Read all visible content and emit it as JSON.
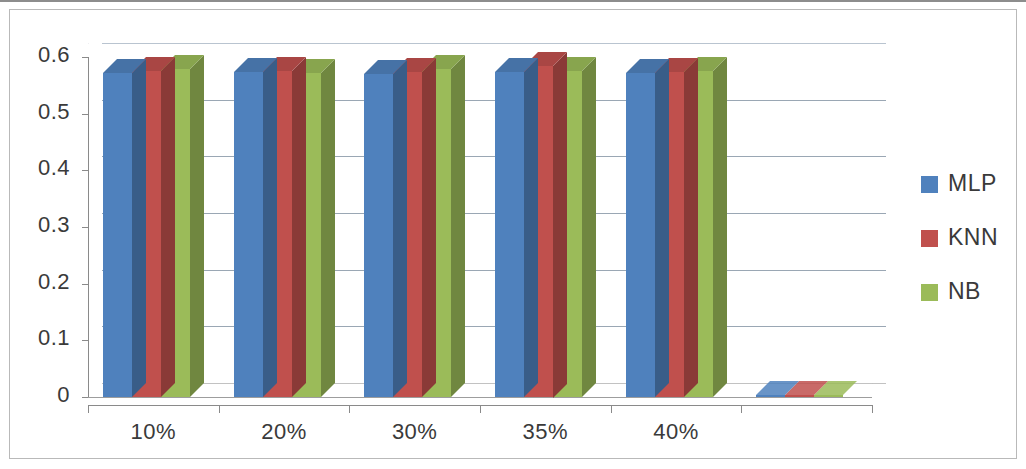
{
  "chart_data": {
    "type": "bar",
    "title": "",
    "subtitle": "",
    "xlabel": "",
    "ylabel": "",
    "categories": [
      "10%",
      "20%",
      "30%",
      "35%",
      "40%",
      ""
    ],
    "series": [
      {
        "name": "MLP",
        "color": "#4f81bd",
        "values": [
          0.572,
          0.574,
          0.57,
          0.573,
          0.572,
          0.0
        ]
      },
      {
        "name": "KNN",
        "color": "#c0504d",
        "values": [
          0.575,
          0.576,
          0.574,
          0.585,
          0.574,
          0.0
        ]
      },
      {
        "name": "NB",
        "color": "#9bbb59",
        "values": [
          0.578,
          0.572,
          0.578,
          0.575,
          0.576,
          0.0
        ]
      }
    ],
    "ylim": [
      0,
      0.6
    ],
    "yticks": [
      "0",
      "0.1",
      "0.2",
      "0.3",
      "0.4",
      "0.5",
      "0.6"
    ],
    "ytick_values": [
      0,
      0.1,
      0.2,
      0.3,
      0.4,
      0.5,
      0.6
    ],
    "grid": true,
    "grid_axis": "y",
    "legend_position": "right",
    "three_d": true
  },
  "legend": {
    "entries": [
      {
        "label": "MLP",
        "color": "#4f81bd"
      },
      {
        "label": "KNN",
        "color": "#c0504d"
      },
      {
        "label": "NB",
        "color": "#9bbb59"
      }
    ]
  },
  "axes": {
    "y_tick_labels": [
      "0.6",
      "0.5",
      "0.4",
      "0.3",
      "0.2",
      "0.1",
      "0"
    ],
    "x_tick_labels": [
      "10%",
      "20%",
      "30%",
      "35%",
      "40%"
    ]
  },
  "colors": {
    "series_mlp": "#4f81bd",
    "series_knn": "#c0504d",
    "series_nb": "#9bbb59",
    "gridline": "#9aa7b4",
    "axis": "#8a8a8a",
    "text": "#3a3a3a",
    "background": "#ffffff"
  }
}
